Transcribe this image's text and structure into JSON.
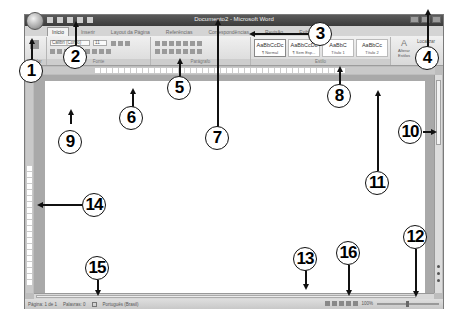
{
  "window": {
    "title": "Documento2 - Microsoft Word"
  },
  "tabs": [
    {
      "label": "Início",
      "active": true
    },
    {
      "label": "Inserir",
      "active": false
    },
    {
      "label": "Layout da Página",
      "active": false
    },
    {
      "label": "Referências",
      "active": false
    },
    {
      "label": "Correspondências",
      "active": false
    },
    {
      "label": "Revisão",
      "active": false
    },
    {
      "label": "Exibição",
      "active": false
    }
  ],
  "ribbon": {
    "clipboard_label": "Colar",
    "font_group_label": "Fonte",
    "font_name": "Calibri (Corpo)",
    "font_size": "11",
    "paragraph_group_label": "Parágrafo",
    "styles_group_label": "Estilo",
    "styles": [
      {
        "sample": "AaBbCcDc",
        "name": "¶ Normal"
      },
      {
        "sample": "AaBbCcDc",
        "name": "¶ Sem Esp..."
      },
      {
        "sample": "AaBbC",
        "name": "Título 1"
      },
      {
        "sample": "AaBbCc",
        "name": "Título 2"
      }
    ],
    "change_styles_label": "Alterar Estilos",
    "editing_label": "Localizar"
  },
  "status_bar": {
    "page": "Página: 1 de 1",
    "words": "Palavras: 0",
    "language": "Português (Brasil)",
    "zoom": "100%"
  },
  "callouts": [
    {
      "n": "1",
      "target": "office-button"
    },
    {
      "n": "2",
      "target": "quick-access-toolbar"
    },
    {
      "n": "3",
      "target": "ribbon-tabs"
    },
    {
      "n": "4",
      "target": "window-controls"
    },
    {
      "n": "5",
      "target": "ribbon-groups"
    },
    {
      "n": "6",
      "target": "horizontal-ruler"
    },
    {
      "n": "7",
      "target": "title-bar"
    },
    {
      "n": "8",
      "target": "styles-group"
    },
    {
      "n": "9",
      "target": "document-page"
    },
    {
      "n": "10",
      "target": "vertical-scrollbar"
    },
    {
      "n": "11",
      "target": "page-area"
    },
    {
      "n": "12",
      "target": "zoom-slider"
    },
    {
      "n": "13",
      "target": "horizontal-scrollbar"
    },
    {
      "n": "14",
      "target": "vertical-ruler"
    },
    {
      "n": "15",
      "target": "status-bar"
    },
    {
      "n": "16",
      "target": "view-buttons"
    }
  ]
}
